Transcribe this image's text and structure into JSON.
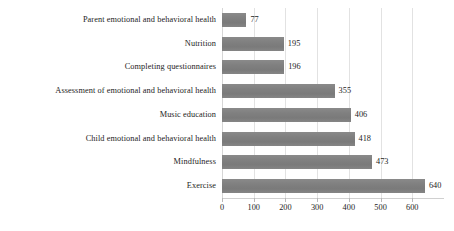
{
  "chart_data": {
    "type": "bar",
    "orientation": "horizontal",
    "title": "",
    "subtitle": "",
    "xlabel": "",
    "ylabel": "",
    "categories": [
      "Parent emotional and behavioral health",
      "Nutrition",
      "Completing questionnaires",
      "Assessment of emotional and behavioral health",
      "Music education",
      "Child emotional and behavioral health",
      "Mindfulness",
      "Exercise"
    ],
    "values": [
      77,
      195,
      196,
      355,
      406,
      418,
      473,
      640
    ],
    "data_labels": [
      "77",
      "195",
      "196",
      "355",
      "406",
      "418",
      "473",
      "640"
    ],
    "xticks": [
      0,
      100,
      200,
      300,
      400,
      500,
      600
    ],
    "xtick_labels": [
      "0",
      "100",
      "200",
      "300",
      "400",
      "500",
      "600"
    ],
    "xlim": [
      0,
      700
    ],
    "grid": "vertical",
    "legend": "none",
    "bar_color": "#7f7f7f",
    "gridline_color": "#e2e2e2",
    "axis_color": "#d0d0d0",
    "text_color": "#1d1d1d",
    "background": "#ffffff"
  }
}
